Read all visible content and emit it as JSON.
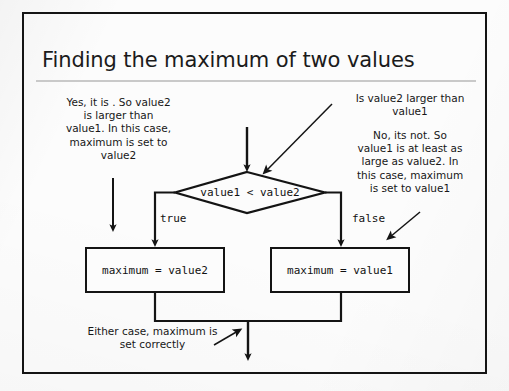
{
  "slide": {
    "title": "Finding the maximum of two values"
  },
  "annotations": {
    "left": "Yes, it is . So value2\nis  larger than\nvalue1. In this case,\nmaximum is set to\nvalue2",
    "top_right": "Is value2 larger than\nvalue1",
    "right": "No, its not. So\nvalue1 is at least as\nlarge as value2. In\nthis case, maximum\nis set to value1",
    "bottom": "Either case, maximum is\nset correctly"
  },
  "flowchart": {
    "decision_text": "value1 < value2",
    "branch_true_label": "true",
    "branch_false_label": "false",
    "box_true_text": "maximum = value2",
    "box_false_text": "maximum = value1"
  },
  "colors": {
    "ink": "#141414",
    "text": "#171717",
    "paper": "#fcfcfc",
    "rule": "#c9c9c9"
  }
}
